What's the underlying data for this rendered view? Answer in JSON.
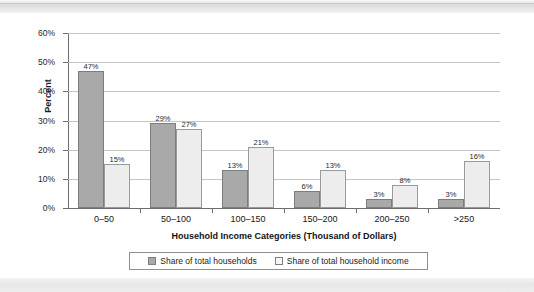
{
  "chart_data": {
    "type": "bar",
    "title": "",
    "xlabel": "Household Income Categories (Thousand of Dollars)",
    "ylabel": "Percent",
    "categories": [
      "0–50",
      "50–100",
      "100–150",
      "150–200",
      "200–250",
      ">250"
    ],
    "series": [
      {
        "name": "Share of total households",
        "color": "#a9a9a9",
        "values": [
          47,
          29,
          13,
          6,
          3,
          3
        ],
        "value_labels": [
          "47%",
          "29%",
          "13%",
          "6%",
          "3%",
          "3%"
        ]
      },
      {
        "name": "Share of total household income",
        "color": "#ededed",
        "values": [
          15,
          27,
          21,
          13,
          8,
          16
        ],
        "value_labels": [
          "15%",
          "27%",
          "21%",
          "13%",
          "8%",
          "16%"
        ]
      }
    ],
    "ylim": [
      0,
      60
    ],
    "ytick_values": [
      0,
      10,
      20,
      30,
      40,
      50,
      60
    ],
    "ytick_labels": [
      "0%",
      "10%",
      "20%",
      "30%",
      "40%",
      "50%",
      "60%"
    ],
    "grid": "horizontal",
    "legend_position": "bottom",
    "value_labels_shown": true
  },
  "legend": {
    "items": [
      {
        "label": "Share of total households",
        "swatch": "dark-gray-square"
      },
      {
        "label": "Share of total household income",
        "swatch": "light-gray-square"
      }
    ]
  }
}
